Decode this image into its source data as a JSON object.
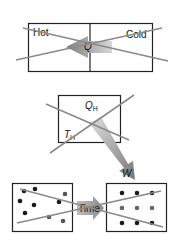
{
  "diagram": {
    "type": "crossed-out thermodynamics illustrations",
    "panels": [
      {
        "id": "heat-flow",
        "labels": {
          "left": "Hot",
          "right": "Cold",
          "arrow": "Q"
        },
        "arrow_direction": "cold-to-hot",
        "crossed_out": true
      },
      {
        "id": "heat-engine",
        "labels": {
          "heat": "Q",
          "heat_sub": "H",
          "temp": "T",
          "temp_sub": "H",
          "work": "W"
        },
        "crossed_out": true
      },
      {
        "id": "entropy-time",
        "labels": {
          "arrow": "Time"
        },
        "left_state": "disordered",
        "right_state": "ordered",
        "crossed_out": true
      }
    ],
    "colors": {
      "box_stroke": "#222222",
      "cross_line": "#8a8a8a",
      "arrow_fill": "#9a9a9a",
      "dot_dark": "#1a1a1a",
      "dot_gray": "#666666"
    }
  }
}
